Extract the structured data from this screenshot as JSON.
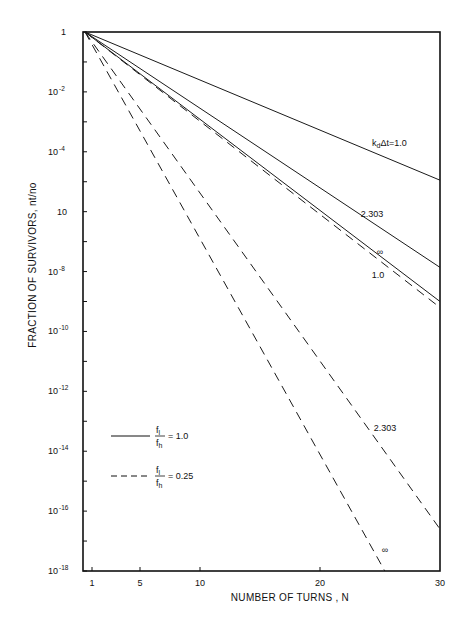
{
  "chart_data": {
    "type": "line",
    "title": "",
    "xlabel": "NUMBER OF TURNS , N",
    "ylabel": "FRACTION OF SURVIVORS, nt/no",
    "xscale": "linear",
    "yscale": "log",
    "xlim": [
      1,
      30
    ],
    "ylim": [
      1e-18,
      1
    ],
    "grid": false,
    "x_ticks": [
      {
        "value": 1,
        "label": "1"
      },
      {
        "value": 5,
        "label": "5"
      },
      {
        "value": 10,
        "label": "10"
      },
      {
        "value": 20,
        "label": "20"
      },
      {
        "value": 30,
        "label": "30"
      }
    ],
    "y_ticks": [
      {
        "exp": 0,
        "base": "1",
        "sup": ""
      },
      {
        "exp": -1,
        "base": "",
        "sup": ""
      },
      {
        "exp": -2,
        "base": "10",
        "sup": "-2"
      },
      {
        "exp": -3,
        "base": "",
        "sup": ""
      },
      {
        "exp": -4,
        "base": "10",
        "sup": "-4"
      },
      {
        "exp": -5,
        "base": "",
        "sup": ""
      },
      {
        "exp": -6,
        "base": "10",
        "sup": ""
      },
      {
        "exp": -7,
        "base": "",
        "sup": ""
      },
      {
        "exp": -8,
        "base": "10",
        "sup": "-8"
      },
      {
        "exp": -9,
        "base": "",
        "sup": ""
      },
      {
        "exp": -10,
        "base": "10",
        "sup": "-10"
      },
      {
        "exp": -11,
        "base": "",
        "sup": ""
      },
      {
        "exp": -12,
        "base": "10",
        "sup": "-12"
      },
      {
        "exp": -13,
        "base": "",
        "sup": ""
      },
      {
        "exp": -14,
        "base": "10",
        "sup": "-14"
      },
      {
        "exp": -15,
        "base": "",
        "sup": ""
      },
      {
        "exp": -16,
        "base": "10",
        "sup": "-16"
      },
      {
        "exp": -17,
        "base": "",
        "sup": ""
      },
      {
        "exp": -18,
        "base": "10",
        "sup": "-18"
      }
    ],
    "series": [
      {
        "name": "kdΔt=1.0, fl/fh=1.0",
        "style": "solid",
        "x": [
          1,
          30
        ],
        "log10_y": [
          0,
          -4.95
        ],
        "label": "kdΔt=1.0",
        "label_pos": [
          405,
          146
        ]
      },
      {
        "name": "kdΔt=2.303, fl/fh=1.0",
        "style": "solid",
        "x": [
          1,
          30
        ],
        "log10_y": [
          0,
          -7.86
        ],
        "label": "2.303",
        "label_pos": [
          372,
          217
        ]
      },
      {
        "name": "kdΔt=∞, fl/fh=1.0",
        "style": "solid",
        "x": [
          1,
          30
        ],
        "log10_y": [
          0,
          -9.0
        ],
        "label": "∞",
        "label_pos": [
          380,
          255
        ]
      },
      {
        "name": "kdΔt=1.0, fl/fh=0.25",
        "style": "dashed",
        "x": [
          1,
          30
        ],
        "log10_y": [
          0,
          -9.2
        ],
        "label": "1.0",
        "label_pos": [
          378,
          278
        ]
      },
      {
        "name": "kdΔt=2.303, fl/fh=0.25",
        "style": "dashed",
        "x": [
          1,
          30
        ],
        "log10_y": [
          0,
          -16.6
        ],
        "label": "2.303",
        "label_pos": [
          385,
          431
        ]
      },
      {
        "name": "kdΔt=∞, fl/fh=0.25",
        "style": "dashed",
        "x": [
          1,
          25.4
        ],
        "log10_y": [
          0,
          -18
        ],
        "label": "∞",
        "label_pos": [
          385,
          553
        ]
      }
    ],
    "legend": {
      "position": "lower-left",
      "entries": [
        {
          "style": "solid",
          "numerator": "f",
          "num_sub": "l",
          "denominator": "f",
          "den_sub": "h",
          "value": "= 1.0"
        },
        {
          "style": "dashed",
          "numerator": "f",
          "num_sub": "l",
          "denominator": "f",
          "den_sub": "h",
          "value": "= 0.25"
        }
      ]
    }
  }
}
